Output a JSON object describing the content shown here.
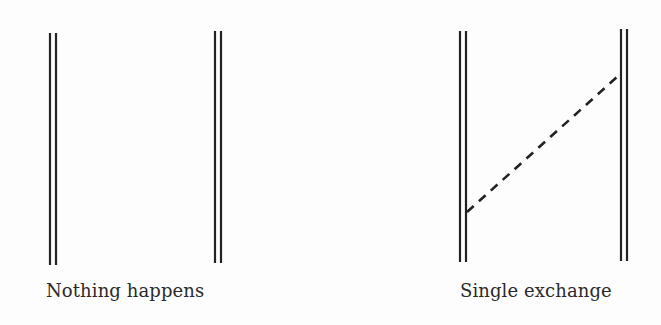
{
  "figure": {
    "panels": [
      {
        "id": "left",
        "caption": "Nothing happens",
        "worldlines": [
          {
            "x": 53,
            "y1": 33,
            "y2": 265
          },
          {
            "x": 218,
            "y1": 31,
            "y2": 263
          }
        ],
        "exchange": null
      },
      {
        "id": "right",
        "caption": "Single exchange",
        "worldlines": [
          {
            "x": 463,
            "y1": 31,
            "y2": 262
          },
          {
            "x": 624,
            "y1": 29,
            "y2": 261
          }
        ],
        "exchange": {
          "style": "dashed",
          "from": [
            467,
            212
          ],
          "to": [
            617,
            77
          ]
        }
      }
    ],
    "line_color": "#222222"
  }
}
